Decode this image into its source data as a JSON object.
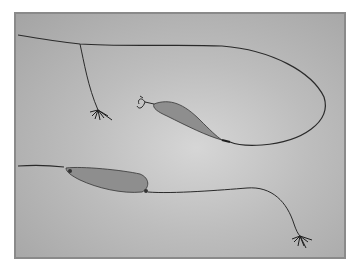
{
  "image": {
    "subject": "Two fishing spoon lures with fly-hook trailers on leader line",
    "alt": "Photograph of two spoon lures connected by fishing line with feathered fly hooks"
  },
  "colors": {
    "background": "#bdbdbd",
    "frame_border": "#8a8a8a",
    "line": "#2a2a2a",
    "spoon_fill": "#8e8e8e"
  }
}
